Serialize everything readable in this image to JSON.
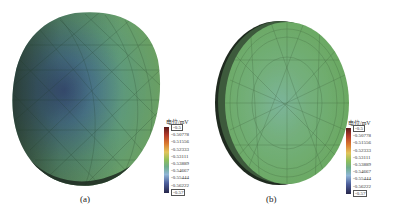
{
  "figure": {
    "panels": [
      {
        "id": "a",
        "caption": "(a)",
        "shape": "dome",
        "description": "Hemispherical dome mesh with potential distribution: dark blue region on the left, green on the right"
      },
      {
        "id": "b",
        "caption": "(b)",
        "shape": "disc",
        "description": "Flat circular disc mesh with nearly uniform green potential, light blue center"
      }
    ],
    "legend": {
      "title": "电位/mV",
      "max_label": "-0.5",
      "min_label": "-0.57",
      "ticks": [
        "-0.50778",
        "-0.51556",
        "-0.52333",
        "-0.53111",
        "-0.53889",
        "-0.54667",
        "-0.55444",
        "-0.56222"
      ],
      "colormap": [
        "#5a1a1a",
        "#b23a2a",
        "#d9782f",
        "#e2c45a",
        "#8fbf5a",
        "#6fae8a",
        "#8fb5d6",
        "#4d5f9c",
        "#26264a"
      ]
    }
  }
}
